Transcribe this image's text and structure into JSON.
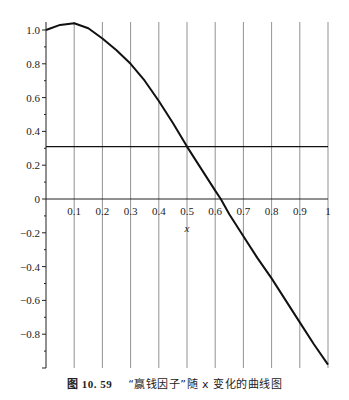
{
  "caption": {
    "label": "图 10. 59",
    "text": "“赢钱因子”随 x 变化的曲线图"
  },
  "chart_data": {
    "type": "line",
    "title": "",
    "caption": "图 10. 59 “赢钱因子”随 x 变化的曲线图",
    "xlabel": "x",
    "ylabel": "",
    "xlim": [
      0,
      1
    ],
    "ylim": [
      -1.0,
      1.05
    ],
    "x_ticks": [
      "0.1",
      "0.2",
      "0.3",
      "0.4",
      "0.5",
      "0.6",
      "0.7",
      "0.8",
      "0.9",
      "1"
    ],
    "y_ticks": [
      "1.0",
      "0.8",
      "0.6",
      "0.4",
      "0.2",
      "0",
      "-0.2",
      "-0.4",
      "-0.6",
      "-0.8"
    ],
    "grid": "vertical",
    "series": [
      {
        "name": "赢钱因子",
        "x": [
          0,
          0.05,
          0.1,
          0.15,
          0.2,
          0.25,
          0.3,
          0.35,
          0.4,
          0.45,
          0.5,
          0.55,
          0.6,
          0.62,
          0.65,
          0.7,
          0.75,
          0.8,
          0.85,
          0.9,
          0.95,
          1.0
        ],
        "values": [
          1.0,
          1.03,
          1.04,
          1.01,
          0.95,
          0.88,
          0.8,
          0.7,
          0.58,
          0.45,
          0.31,
          0.18,
          0.05,
          0.0,
          -0.09,
          -0.22,
          -0.35,
          -0.47,
          -0.6,
          -0.73,
          -0.86,
          -0.98
        ]
      },
      {
        "name": "horizontal reference",
        "x": [
          0,
          1
        ],
        "values": [
          0.31,
          0.31
        ]
      }
    ]
  }
}
